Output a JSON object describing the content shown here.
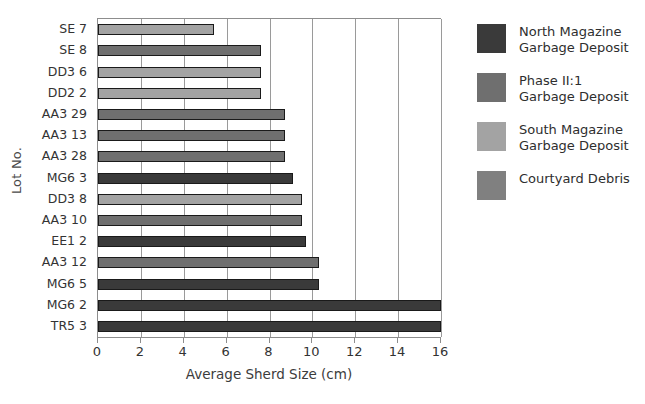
{
  "chart_data": {
    "type": "bar",
    "orientation": "horizontal",
    "title": "",
    "xlabel": "Average Sherd Size (cm)",
    "ylabel": "Lot No.",
    "xlim": [
      0,
      16
    ],
    "xticks": [
      0,
      2,
      4,
      6,
      8,
      10,
      12,
      14,
      16
    ],
    "xtick_labels": [
      "0",
      "2",
      "4",
      "6",
      "8",
      "10",
      "12",
      "14",
      "16"
    ],
    "grid": "vertical",
    "legend_position": "right",
    "categories": [
      "SE  7",
      "SE  8",
      "DD3 6",
      "DD2 2",
      "AA3 29",
      "AA3 13",
      "AA3 28",
      "MG6 3",
      "DD3 8",
      "AA3 10",
      "EE1 2",
      "AA3 12",
      "MG6 5",
      "MG6 2",
      "TR5 3"
    ],
    "values": [
      5.4,
      7.6,
      7.6,
      7.6,
      8.7,
      8.7,
      8.7,
      9.1,
      9.5,
      9.5,
      9.7,
      10.3,
      10.3,
      16.0,
      16.0
    ],
    "group_of_bar": [
      "South Magazine Garbage Deposit",
      "Phase II:1 Garbage Deposit",
      "South Magazine Garbage Deposit",
      "South Magazine Garbage Deposit",
      "Phase II:1 Garbage Deposit",
      "Phase II:1 Garbage Deposit",
      "Phase II:1 Garbage Deposit",
      "North Magazine Garbage Deposit",
      "South Magazine Garbage Deposit",
      "Phase II:1 Garbage Deposit",
      "North Magazine Garbage Deposit",
      "Phase II:1 Garbage Deposit",
      "North Magazine Garbage Deposit",
      "North Magazine Garbage Deposit",
      "North Magazine Garbage Deposit"
    ],
    "bar_colors": [
      "#a3a3a3",
      "#6f6f6f",
      "#a3a3a3",
      "#a3a3a3",
      "#6f6f6f",
      "#6f6f6f",
      "#6f6f6f",
      "#3a3a3a",
      "#a3a3a3",
      "#6f6f6f",
      "#3a3a3a",
      "#6f6f6f",
      "#3a3a3a",
      "#3a3a3a",
      "#3a3a3a"
    ],
    "legend": [
      {
        "label_line1": "North Magazine",
        "label_line2": "Garbage Deposit",
        "color": "#3a3a3a"
      },
      {
        "label_line1": "Phase II:1",
        "label_line2": "Garbage Deposit",
        "color": "#6f6f6f"
      },
      {
        "label_line1": "South Magazine",
        "label_line2": "Garbage Deposit",
        "color": "#a3a3a3"
      },
      {
        "label_line1": "Courtyard Debris",
        "label_line2": "",
        "color": "#808080"
      }
    ]
  }
}
